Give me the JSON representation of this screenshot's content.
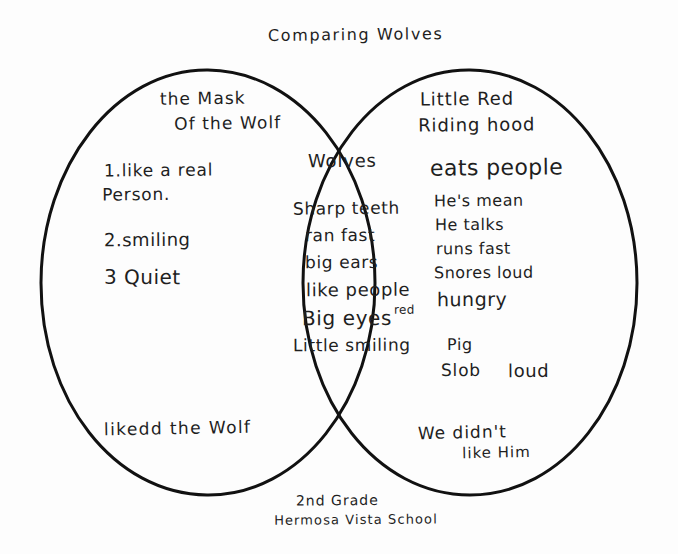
{
  "page": {
    "background_color": "#fdfdfd",
    "ink_color": "#1f1f1f",
    "title": "Comparing Wolves"
  },
  "diagram": {
    "type": "venn",
    "stroke_color": "#111111",
    "stroke_width": 3,
    "left_circle": {
      "cx": 208,
      "cy": 283,
      "rx": 167,
      "ry": 213
    },
    "right_circle": {
      "cx": 470,
      "cy": 283,
      "rx": 167,
      "ry": 213
    }
  },
  "left": {
    "heading_line1": "the Mask",
    "heading_line2": "Of the Wolf",
    "items": [
      {
        "line1": "1.like a real",
        "line2": "Person."
      },
      {
        "line1": "2.smiling"
      },
      {
        "line1": "3 Quiet"
      }
    ],
    "bottom_note": "likedd the Wolf"
  },
  "center": {
    "heading": "Wolves",
    "items": [
      "Sharp teeth",
      "ran fast",
      "big ears",
      "like people",
      "Big eyes",
      "Little smiling"
    ],
    "annotation_red": "red"
  },
  "right": {
    "heading_line1": "Little Red",
    "heading_line2": "Riding hood",
    "emphasis": "eats people",
    "items": [
      "He's mean",
      "He talks",
      "runs fast",
      "Snores loud",
      "hungry"
    ],
    "extra": {
      "pig": "Pig",
      "slob": "Slob",
      "loud": "loud"
    },
    "bottom_line1": "We didn't",
    "bottom_line2": "like Him"
  },
  "footer": {
    "line1": "2nd Grade",
    "line2": "Hermosa Vista School"
  }
}
